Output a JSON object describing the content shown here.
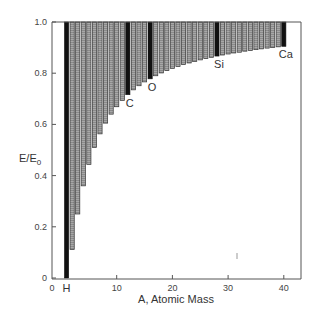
{
  "chart_data": {
    "type": "bar",
    "title": "",
    "xlabel": "A, Atomic Mass",
    "ylabel": "E/E0",
    "ylabel_main": "E/E",
    "ylabel_sub": "0",
    "xlim": [
      -1.6,
      43
    ],
    "ylim": [
      0,
      1.0
    ],
    "grid": false,
    "legend": null,
    "x_ticks": [
      0,
      10,
      20,
      30,
      40
    ],
    "x_tick_labels": [
      "0",
      "10",
      "20",
      "30",
      "40"
    ],
    "y_ticks": [
      0,
      0.2,
      0.4,
      0.6,
      0.8,
      1.0
    ],
    "y_tick_labels": [
      "0",
      "0.2",
      "0.4",
      "0.6",
      "0.8",
      "1.0"
    ],
    "x": [
      1,
      2,
      3,
      4,
      5,
      6,
      7,
      8,
      9,
      10,
      11,
      12,
      13,
      14,
      15,
      16,
      17,
      18,
      19,
      20,
      21,
      22,
      23,
      24,
      25,
      26,
      27,
      28,
      29,
      30,
      31,
      32,
      33,
      34,
      35,
      36,
      37,
      38,
      39,
      40
    ],
    "bar_top": 1.0,
    "bar_bottom": [
      0.0,
      0.111,
      0.25,
      0.36,
      0.444,
      0.51,
      0.563,
      0.605,
      0.64,
      0.669,
      0.694,
      0.716,
      0.735,
      0.751,
      0.766,
      0.778,
      0.79,
      0.801,
      0.81,
      0.819,
      0.826,
      0.834,
      0.84,
      0.846,
      0.852,
      0.857,
      0.862,
      0.867,
      0.871,
      0.875,
      0.879,
      0.882,
      0.886,
      0.889,
      0.892,
      0.895,
      0.898,
      0.9,
      0.903,
      0.905
    ],
    "highlighted": [
      {
        "A": 1,
        "label": "H",
        "label_position": "below-axis"
      },
      {
        "A": 12,
        "label": "C"
      },
      {
        "A": 16,
        "label": "O"
      },
      {
        "A": 28,
        "label": "Si"
      },
      {
        "A": 40,
        "label": "Ca"
      }
    ],
    "colors": {
      "highlight_bar": "#111111",
      "normal_bar_fill": "#a8a8a8",
      "normal_bar_stroke": "#333333",
      "axis": "#555555"
    }
  }
}
